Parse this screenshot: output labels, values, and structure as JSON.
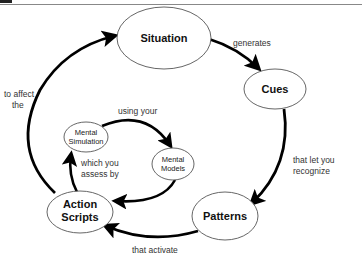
{
  "diagram": {
    "colors": {
      "background": "#ffffff",
      "arrow": "#000000",
      "node_border": "#555555",
      "text": "#111111",
      "header_rule": "#888888"
    },
    "nodes": {
      "situation": {
        "label": "Situation"
      },
      "cues": {
        "label": "Cues"
      },
      "patterns": {
        "label": "Patterns"
      },
      "action_scripts": {
        "line1": "Action",
        "line2": "Scripts"
      },
      "mental_simulation": {
        "line1": "Mental",
        "line2": "Simulation"
      },
      "mental_models": {
        "line1": "Mental",
        "line2": "Models"
      }
    },
    "edges": {
      "situation_to_cues": {
        "label": "generates"
      },
      "cues_to_patterns": {
        "line1": "that let you",
        "line2": "recognize"
      },
      "patterns_to_action_scripts": {
        "label": "that activate"
      },
      "action_scripts_to_situation": {
        "line1": "to affect",
        "line2": "the"
      },
      "action_scripts_to_mental_simulation": {
        "line1": "which you",
        "line2": "assess by"
      },
      "mental_simulation_to_mental_models": {
        "label": "using your"
      },
      "mental_models_to_action_scripts": {
        "label": ""
      }
    }
  }
}
